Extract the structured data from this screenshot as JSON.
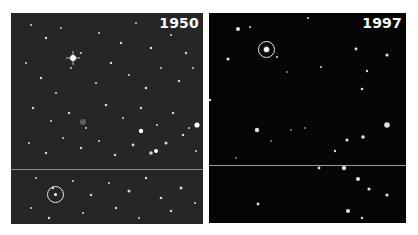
{
  "panels": [
    {
      "id": "left",
      "label": "1950",
      "background": "#262626"
    },
    {
      "id": "right",
      "label": "1997",
      "background": "#050505"
    }
  ],
  "markers": [
    {
      "panel": "left",
      "shape": "circle",
      "color": "#e8e8e8"
    },
    {
      "panel": "right",
      "shape": "circle",
      "color": "#e8e8e8"
    }
  ]
}
